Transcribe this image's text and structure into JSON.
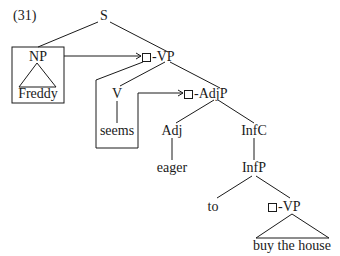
{
  "example_number": "(31)",
  "tree": {
    "root": "S",
    "subject": {
      "label": "NP",
      "word": "Freddy"
    },
    "vp": {
      "label": "-VP"
    },
    "verb": {
      "label": "V",
      "word": "seems"
    },
    "adjp": {
      "label": "-AdjP"
    },
    "adj": {
      "label": "Adj",
      "word": "eager"
    },
    "infc": {
      "label": "InfC"
    },
    "infp": {
      "label": "InfP"
    },
    "to": {
      "word": "to"
    },
    "lower_vp": {
      "label": "-VP",
      "words": "buy the house"
    }
  },
  "colors": {
    "line": "#1a1a1a",
    "background": "#ffffff"
  }
}
